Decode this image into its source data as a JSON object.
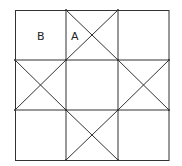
{
  "diagram": {
    "type": "quilt-grid-3x3",
    "colors": {
      "line": "#333333",
      "background": "#ffffff",
      "label": "#222222"
    },
    "grid": {
      "xs": [
        15,
        66,
        118,
        169
      ],
      "ys": [
        10,
        60,
        110,
        160
      ]
    },
    "labels": [
      {
        "text": "B",
        "x": 41,
        "y": 40
      },
      {
        "text": "A",
        "x": 75,
        "y": 40
      }
    ],
    "label_B": "B",
    "label_A": "A"
  }
}
